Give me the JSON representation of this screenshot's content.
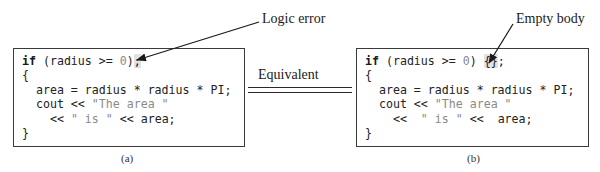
{
  "figure": {
    "panels": [
      {
        "id": "a",
        "caption": "(a)",
        "code_lines": [
          {
            "segments": [
              {
                "t": "if",
                "c": "kw"
              },
              {
                "t": " (radius >= ",
                "c": ""
              },
              {
                "t": "0",
                "c": "num"
              },
              {
                "t": ")",
                "c": ""
              },
              {
                "t": ";",
                "c": "hl"
              }
            ]
          },
          {
            "segments": [
              {
                "t": "{",
                "c": ""
              }
            ]
          },
          {
            "segments": [
              {
                "t": "  area = radius * radius * PI;",
                "c": ""
              }
            ]
          },
          {
            "segments": [
              {
                "t": "  cout << ",
                "c": ""
              },
              {
                "t": "\"The area \"",
                "c": "str"
              }
            ]
          },
          {
            "segments": [
              {
                "t": "    << ",
                "c": ""
              },
              {
                "t": "\" is \"",
                "c": "str"
              },
              {
                "t": " << area;",
                "c": ""
              }
            ]
          },
          {
            "segments": [
              {
                "t": "}",
                "c": ""
              }
            ]
          }
        ],
        "annotation": "Logic error"
      },
      {
        "id": "b",
        "caption": "(b)",
        "code_lines": [
          {
            "segments": [
              {
                "t": "if",
                "c": "kw"
              },
              {
                "t": " (radius >= ",
                "c": ""
              },
              {
                "t": "0",
                "c": "num"
              },
              {
                "t": ") ",
                "c": ""
              },
              {
                "t": "{}",
                "c": "hl"
              },
              {
                "t": ";",
                "c": ""
              }
            ]
          },
          {
            "segments": [
              {
                "t": "{",
                "c": ""
              }
            ]
          },
          {
            "segments": [
              {
                "t": "  area = radius * radius * PI;",
                "c": ""
              }
            ]
          },
          {
            "segments": [
              {
                "t": "  cout << ",
                "c": ""
              },
              {
                "t": "\"The area \"",
                "c": "str"
              }
            ]
          },
          {
            "segments": [
              {
                "t": "    <<  ",
                "c": ""
              },
              {
                "t": "\" is \"",
                "c": "str"
              },
              {
                "t": " <<  area;",
                "c": ""
              }
            ]
          },
          {
            "segments": [
              {
                "t": "}",
                "c": ""
              }
            ]
          }
        ],
        "annotation": "Empty body"
      }
    ],
    "connector_label": "Equivalent",
    "colors": {
      "border": "#3a3a3a",
      "code_text": "#222222",
      "string_literal": "#8a8a8a",
      "highlight": "#e2e2e2",
      "arrow": "#1a1a1a"
    }
  }
}
